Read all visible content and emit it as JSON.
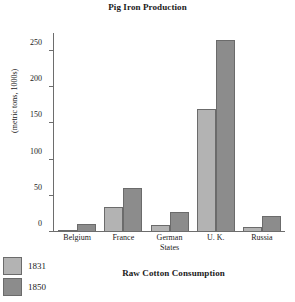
{
  "figure": {
    "title": "Pig Iron Production",
    "next_figure_title": "Raw Cotton Consumption"
  },
  "colors": {
    "series_1831": "#b3b3b3",
    "series_1850": "#8c8c8c",
    "axis": "#6d6d6d",
    "text": "#1a1a1a",
    "background": "#ffffff"
  },
  "legend": {
    "position": "bottom-left",
    "items": [
      {
        "label": "1831"
      },
      {
        "label": "1850"
      }
    ]
  },
  "axis": {
    "y_caption": "(metric tons, 1000s)",
    "y_ticks": [
      "0",
      "50",
      "100",
      "150",
      "200",
      "250"
    ]
  },
  "chart_data": {
    "type": "bar",
    "title": "Pig Iron Production",
    "xlabel": "",
    "ylabel": "(metric tons, 1000s)",
    "ylim": [
      0,
      275
    ],
    "yticks": [
      0,
      50,
      100,
      150,
      200,
      250
    ],
    "grid": false,
    "legend_position": "bottom-left",
    "categories": [
      "Belgium",
      "France",
      "German States",
      "U. K.",
      "Russia"
    ],
    "category_lines": [
      [
        "Belgium"
      ],
      [
        "France"
      ],
      [
        "German",
        "States"
      ],
      [
        "U. K."
      ],
      [
        "Russia"
      ]
    ],
    "series": [
      {
        "name": "1831",
        "color": "#b3b3b3",
        "values": [
          2,
          34,
          9,
          170,
          6
        ]
      },
      {
        "name": "1850",
        "color": "#8c8c8c",
        "values": [
          10,
          60,
          26,
          265,
          21
        ]
      }
    ]
  }
}
